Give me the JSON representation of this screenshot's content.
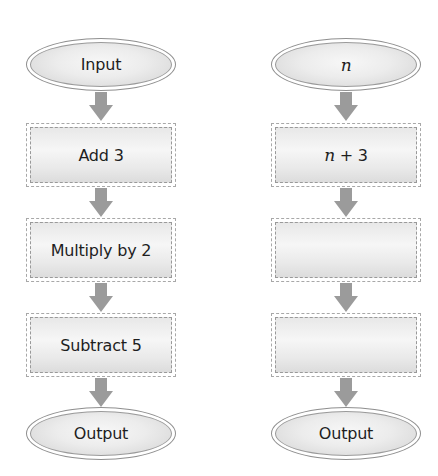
{
  "left_flowchart": {
    "start": "Input",
    "steps": [
      "Add 3",
      "Multiply by 2",
      "Subtract 5"
    ],
    "end": "Output"
  },
  "right_flowchart": {
    "start_var": "n",
    "steps": [
      {
        "var": "n",
        "rest": " + 3"
      },
      {
        "var": "",
        "rest": ""
      },
      {
        "var": "",
        "rest": ""
      }
    ],
    "end": "Output"
  },
  "colors": {
    "arrow": "#9b9b9b",
    "border": "#999999",
    "fill": "#e8e8e8",
    "text": "#1e1e1e"
  }
}
